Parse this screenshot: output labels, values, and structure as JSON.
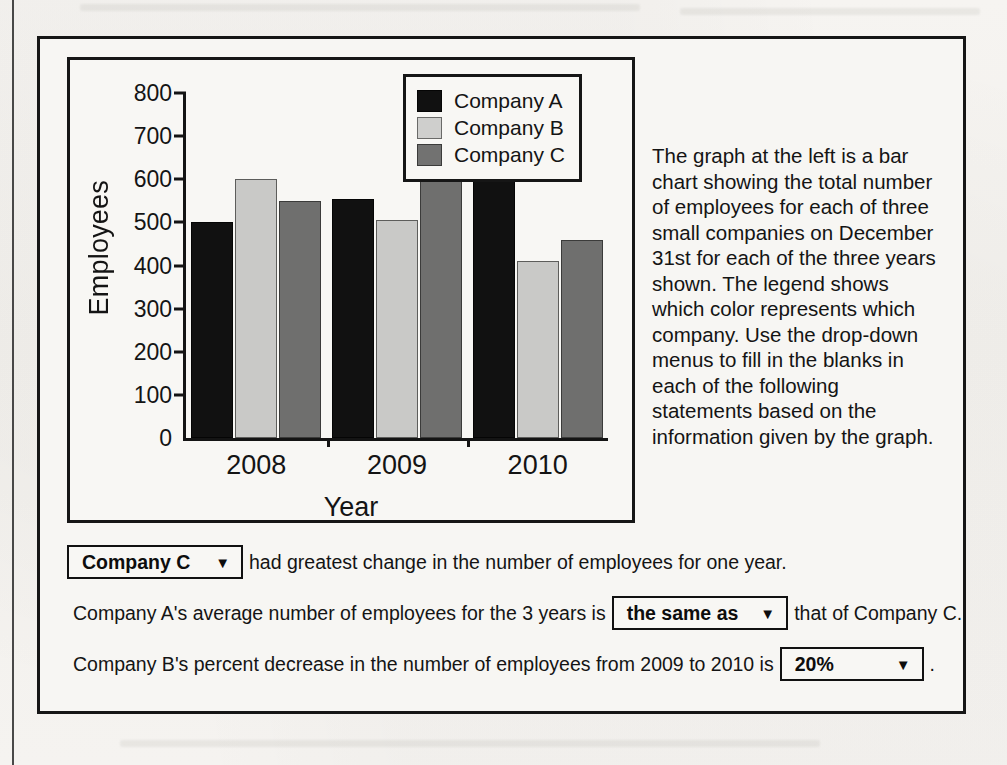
{
  "chart_data": {
    "type": "bar",
    "title": "",
    "xlabel": "Year",
    "ylabel": "Employees",
    "categories": [
      "2008",
      "2009",
      "2010"
    ],
    "series": [
      {
        "name": "Company A",
        "color": "#111111",
        "values": [
          500,
          555,
          610
        ]
      },
      {
        "name": "Company B",
        "color": "#c9c9c7",
        "values": [
          600,
          505,
          410
        ]
      },
      {
        "name": "Company C",
        "color": "#6f6f6e",
        "values": [
          550,
          655,
          460
        ]
      }
    ],
    "ylim": [
      0,
      800
    ],
    "yticks": [
      0,
      100,
      200,
      300,
      400,
      500,
      600,
      700,
      800
    ],
    "ytick_labels": [
      "0",
      "100",
      "200",
      "300",
      "400",
      "500",
      "600",
      "700",
      "800"
    ],
    "grid": false,
    "legend_position": "top-right"
  },
  "legend": {
    "entries": [
      {
        "label": "Company A",
        "swatch": "black-swatch"
      },
      {
        "label": "Company B",
        "swatch": "light-gray-swatch"
      },
      {
        "label": "Company C",
        "swatch": "dark-gray-swatch"
      }
    ]
  },
  "description": {
    "text": "The graph at the left is a bar chart showing the total number of employees for each of three small companies on December 31st for each of the three years shown. The legend shows which color represents which company. Use the drop-down menus to fill in the blanks in each of the following statements based on the information given by the graph."
  },
  "statements": [
    {
      "id": "statement-1",
      "dropdown_value": "Company C",
      "caret": "▼",
      "text_after": "had greatest change in the number of employees for one year."
    },
    {
      "id": "statement-2",
      "text_before": "Company A's average number of employees for the 3 years is",
      "dropdown_value": "the same as",
      "caret": "▼",
      "text_after": "that of Company C."
    },
    {
      "id": "statement-3",
      "text_before": "Company B's percent decrease in the number of employees from 2009 to 2010 is",
      "dropdown_value": "20%",
      "caret": "▼",
      "text_after": "."
    }
  ]
}
